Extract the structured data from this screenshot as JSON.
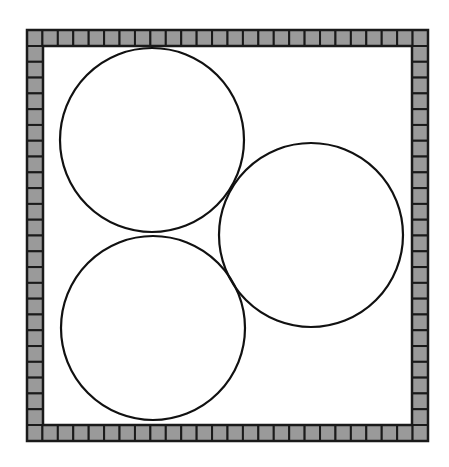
{
  "figure": {
    "background": "#ffffff",
    "frame": {
      "x": 27,
      "y": 30,
      "width": 401,
      "height": 411,
      "border_thickness": 16,
      "tiles_per_side": 26,
      "tile_fill": "#9a9a9a",
      "tile_line": "#1a1a1a"
    },
    "circles": [
      {
        "id": "top-left",
        "cx": 152,
        "cy": 140,
        "r": 92
      },
      {
        "id": "bottom-left",
        "cx": 153,
        "cy": 328,
        "r": 92
      },
      {
        "id": "right",
        "cx": 311,
        "cy": 235,
        "r": 92
      }
    ],
    "circle_stroke": "#111111",
    "circle_stroke_width": 2.2
  }
}
